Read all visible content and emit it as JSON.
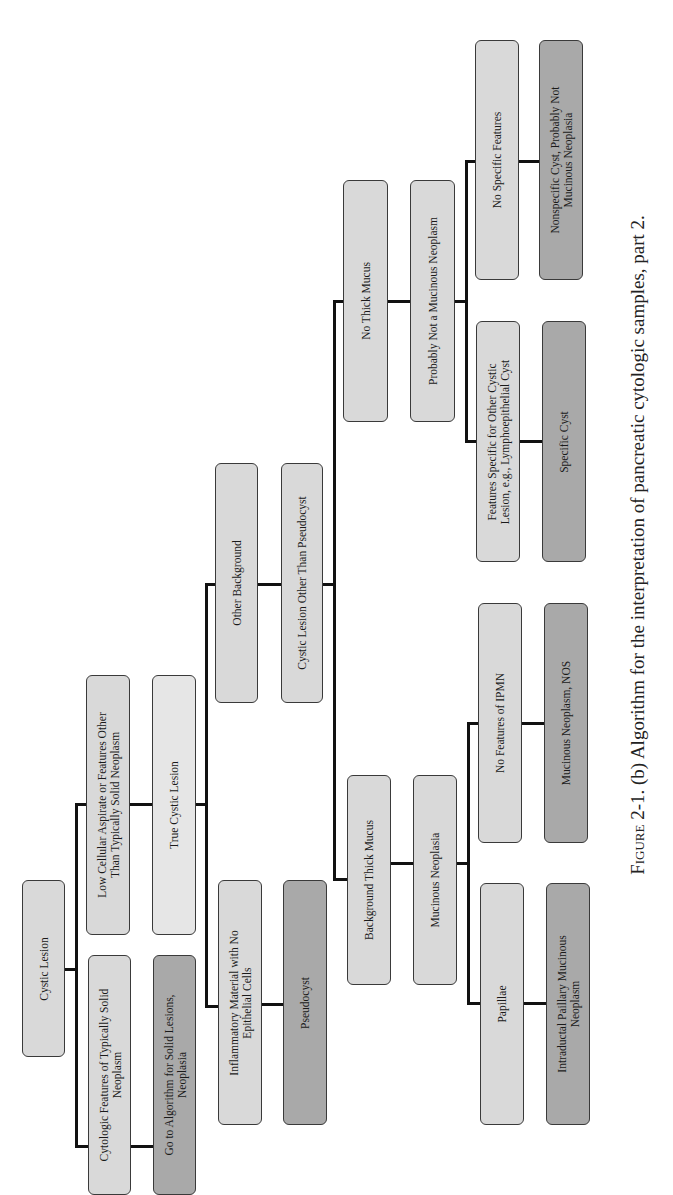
{
  "figure": {
    "caption_label": "Figure 2-1.",
    "caption_text": "(b) Algorithm for the interpretation of pancreatic cytologic samples, part 2."
  },
  "nodes": {
    "cystic_lesion": "Cystic Lesion",
    "cytologic_features": "Cytologic Features of Typically Solid|Neoplasm",
    "go_to_algorithm": "Go to Algorithm for Solid Lesions,|Neoplasia",
    "low_cellular": "Low Cellular Aspirate or Features Other|Than Typically Solid Neoplasm",
    "true_cystic": "True Cystic Lesion",
    "inflammatory": "Inflammatory Material with No|Epithelial Cells",
    "pseudocyst": "Pseudocyst",
    "other_background": "Other Background",
    "cystic_other": "Cystic Lesion Other Than Pseudocyst",
    "background_thick_mucus": "Background Thick Mucus",
    "mucinous_neoplasia": "Mucinous Neoplasia",
    "papillae": "Papillae",
    "ipmn": "Intraductal Paillary Mucinous|Neoplasm",
    "no_features_ipmn": "No Features of IPMN",
    "mucinous_nos": "Mucinous Neoplasm, NOS",
    "no_thick_mucus": "No Thick Mucus",
    "probably_not_mucinous": "Probably Not a Mucinous Neoplasm",
    "features_specific": "Features Specific for Other Cystic|Lesion, e.g., Lymphoepithelial Cyst",
    "specific_cyst": "Specific Cyst",
    "no_specific_features": "No Specific Features",
    "nonspecific_cyst": "Nonspecific Cyst, Probably Not|Mucinous Neoplasia"
  },
  "colors": {
    "finding_box": "#d9d9d9",
    "conclusion_box": "#a9a9a9",
    "connector": "#111111"
  }
}
